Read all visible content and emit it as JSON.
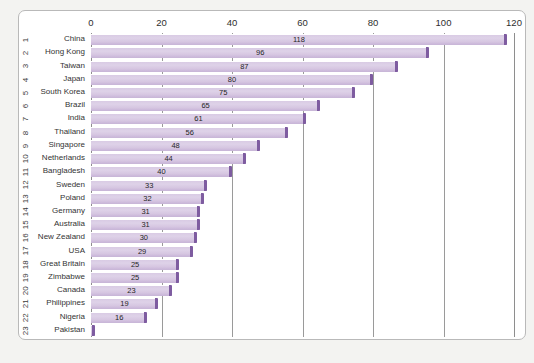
{
  "chart_data": {
    "type": "bar",
    "orientation": "horizontal",
    "title": "",
    "subtitle": "",
    "xlabel": "",
    "ylabel": "",
    "xlim": [
      0,
      120
    ],
    "xticks": [
      0,
      20,
      40,
      60,
      80,
      100,
      120
    ],
    "grid": true,
    "legend": null,
    "categories": [
      "China",
      "Hong Kong",
      "Taiwan",
      "Japan",
      "South Korea",
      "Brazil",
      "India",
      "Thailand",
      "Singapore",
      "Netherlands",
      "Bangladesh",
      "Sweden",
      "Poland",
      "Germany",
      "Australia",
      "New Zealand",
      "USA",
      "Great Britain",
      "Zimbabwe",
      "Canada",
      "Philippines",
      "Nigeria",
      "Pakistan"
    ],
    "values": [
      118,
      96,
      87,
      80,
      75,
      65,
      61,
      56,
      48,
      44,
      40,
      33,
      32,
      31,
      31,
      30,
      29,
      25,
      25,
      23,
      19,
      16,
      1
    ],
    "value_labels": [
      "118",
      "96",
      "87",
      "80",
      "75",
      "65",
      "61",
      "56",
      "48",
      "44",
      "40",
      "33",
      "32",
      "31",
      "31",
      "30",
      "29",
      "25",
      "25",
      "23",
      "19",
      "16",
      ""
    ],
    "ranks": [
      "1",
      "2",
      "3",
      "4",
      "5",
      "6",
      "7",
      "8",
      "9",
      "10",
      "11",
      "12",
      "13",
      "14",
      "15",
      "16",
      "17",
      "18",
      "19",
      "20",
      "21",
      "22",
      "23"
    ]
  },
  "colors": {
    "bar_fill": "#d9cbe4",
    "bar_cap": "#7e5ca0",
    "gridline": "#9a9a9a",
    "panel_background": "#ffffff",
    "page_background": "#f3f3f1",
    "panel_border": "#b9b9b9",
    "text": "#333333"
  }
}
